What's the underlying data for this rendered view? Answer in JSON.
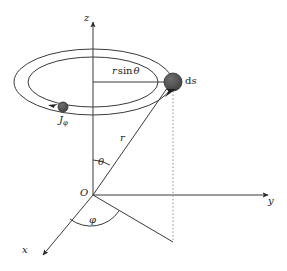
{
  "figure": {
    "background_color": "#ffffff",
    "line_color": "#3a3a3a",
    "marker_color": "#4d4d4d",
    "text_color": "#1a1a1a"
  },
  "axes": {
    "z_label": "z",
    "y_label": "y",
    "x_label": "x",
    "origin_label": "O"
  },
  "angles": {
    "theta_label": "θ",
    "phi_label": "φ"
  },
  "lengths": {
    "radial_label": "r",
    "ring_radius_label_r": "r",
    "ring_radius_label_sin": "sin",
    "ring_radius_label_theta": "θ",
    "ring_radius_full": "r sin θ"
  },
  "markers": {
    "ds_label": "d",
    "ds_label_italic": "s",
    "ds_full": "ds",
    "current_label": "J",
    "current_subscript": "φ",
    "current_full": "Jφ"
  },
  "geometry": {
    "origin_x": 93,
    "origin_y": 195,
    "ring_center_x": 93,
    "ring_center_y": 82,
    "ring_outer_rx": 79,
    "ring_outer_ry": 33,
    "ring_inner_rx": 65,
    "ring_inner_ry": 25,
    "ds_point_x": 173,
    "ds_point_y": 82,
    "ds_marker_radius": 9,
    "current_point_x": 63,
    "current_point_y": 107,
    "current_marker_radius": 5,
    "projection_x": 173,
    "projection_y": 242,
    "z_axis_tip_y": 18,
    "y_axis_tip_x": 272,
    "x_axis_tip_x": 40,
    "x_axis_tip_y": 258
  }
}
